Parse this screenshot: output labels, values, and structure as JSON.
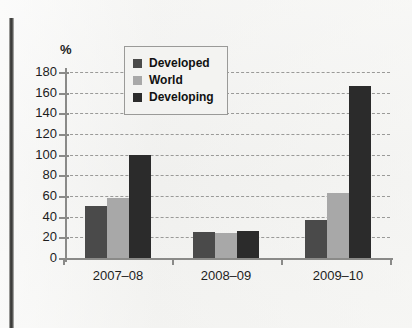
{
  "chart_data": {
    "type": "bar",
    "title": "",
    "subtitle": "",
    "xlabel": "",
    "ylabel": "%",
    "unit_label": "%",
    "categories": [
      "2007–08",
      "2008–09",
      "2009–10"
    ],
    "series": [
      {
        "name": "Developed",
        "color": "#4a4a4a",
        "values": [
          50,
          25,
          37
        ]
      },
      {
        "name": "World",
        "color": "#a8a8a8",
        "values": [
          58,
          24,
          63
        ]
      },
      {
        "name": "Developing",
        "color": "#2b2b2b",
        "values": [
          100,
          26,
          166
        ]
      }
    ],
    "ylim": [
      0,
      180
    ],
    "ytick_step": 20,
    "yticks": [
      180,
      160,
      140,
      120,
      100,
      80,
      60,
      40,
      20,
      0
    ],
    "ytick_labels": [
      "180",
      "160",
      "140",
      "120",
      "100",
      "80",
      "60",
      "40",
      "20",
      "0"
    ],
    "grid": true,
    "grid_style": "dashed",
    "grid_color": "#9a9a98",
    "legend_position": "top-center",
    "legend_entries": [
      "Developed",
      "World",
      "Developing"
    ],
    "background_color": "#f2f2f0",
    "axis_color": "#8a8a88"
  },
  "legend": {
    "items": [
      {
        "label": "Developed"
      },
      {
        "label": "World"
      },
      {
        "label": "Developing"
      }
    ]
  }
}
